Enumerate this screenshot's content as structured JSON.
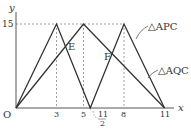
{
  "axes": {
    "x_label": "x",
    "y_label": "y",
    "origin_label": "O",
    "x_ticks": [
      {
        "value": 3,
        "label": "3"
      },
      {
        "value": 5,
        "label": "5"
      },
      {
        "value": 5.5,
        "label_num": "11",
        "label_den": "2"
      },
      {
        "value": 8,
        "label": "8"
      },
      {
        "value": 11,
        "label": "11"
      }
    ],
    "y_ticks": [
      {
        "value": 15,
        "label": "15"
      }
    ]
  },
  "series": [
    {
      "name": "△APC",
      "points": [
        [
          0,
          0
        ],
        [
          3,
          15
        ],
        [
          5.5,
          0
        ],
        [
          8,
          15
        ],
        [
          11,
          0
        ]
      ]
    },
    {
      "name": "△AQC",
      "points": [
        [
          0,
          0
        ],
        [
          5,
          15
        ],
        [
          11,
          0
        ]
      ]
    }
  ],
  "points": [
    {
      "label": "E"
    },
    {
      "label": "F"
    }
  ],
  "colors": {
    "line": "#333333",
    "guide": "#888888",
    "axis": "#555555"
  }
}
